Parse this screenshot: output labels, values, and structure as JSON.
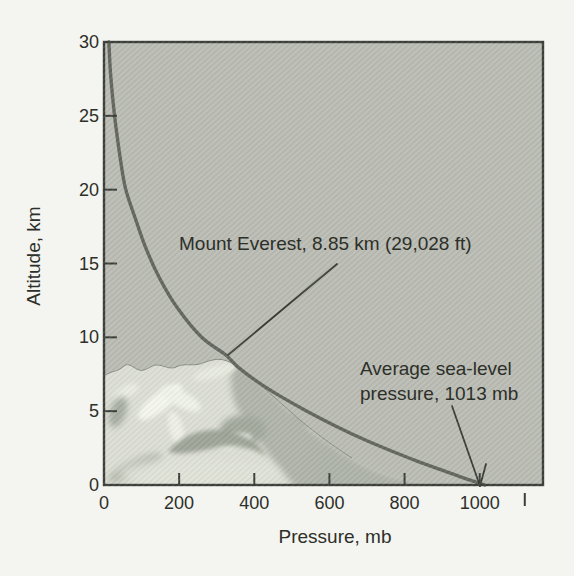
{
  "page": {
    "background_color": "#f4f4f0"
  },
  "chart_data": {
    "type": "line",
    "title": "",
    "xlabel": "Pressure, mb",
    "ylabel": "Altitude, km",
    "xlim": [
      0,
      1170
    ],
    "ylim": [
      0,
      30
    ],
    "x_ticks": [
      0,
      200,
      400,
      600,
      800,
      1000
    ],
    "y_ticks": [
      0,
      5,
      10,
      15,
      20,
      25,
      30
    ],
    "x_unlabeled_minor_tick": 1120,
    "grid": false,
    "legend": null,
    "plot_background": "#babcb4",
    "curve_color": "#63665e",
    "axis_color": "#3c3e39",
    "text_color": "#2d2f29",
    "series": [
      {
        "name": "atmospheric-pressure-vs-altitude",
        "points": [
          {
            "altitude_km": 0,
            "pressure_mb": 1013
          },
          {
            "altitude_km": 0.5,
            "pressure_mb": 955
          },
          {
            "altitude_km": 1,
            "pressure_mb": 900
          },
          {
            "altitude_km": 1.5,
            "pressure_mb": 846
          },
          {
            "altitude_km": 2,
            "pressure_mb": 795
          },
          {
            "altitude_km": 3,
            "pressure_mb": 700
          },
          {
            "altitude_km": 4,
            "pressure_mb": 616
          },
          {
            "altitude_km": 5,
            "pressure_mb": 540
          },
          {
            "altitude_km": 6,
            "pressure_mb": 470
          },
          {
            "altitude_km": 7,
            "pressure_mb": 408
          },
          {
            "altitude_km": 8,
            "pressure_mb": 356
          },
          {
            "altitude_km": 8.85,
            "pressure_mb": 322
          },
          {
            "altitude_km": 10,
            "pressure_mb": 260
          },
          {
            "altitude_km": 12,
            "pressure_mb": 195
          },
          {
            "altitude_km": 14,
            "pressure_mb": 148
          },
          {
            "altitude_km": 16,
            "pressure_mb": 112
          },
          {
            "altitude_km": 18,
            "pressure_mb": 84
          },
          {
            "altitude_km": 20,
            "pressure_mb": 58
          },
          {
            "altitude_km": 22,
            "pressure_mb": 44
          },
          {
            "altitude_km": 24,
            "pressure_mb": 33
          },
          {
            "altitude_km": 26,
            "pressure_mb": 24
          },
          {
            "altitude_km": 28,
            "pressure_mb": 17
          },
          {
            "altitude_km": 30,
            "pressure_mb": 13
          }
        ]
      }
    ],
    "annotations": [
      {
        "id": "everest",
        "text": "Mount Everest, 8.85 km (29,028 ft)",
        "target": {
          "altitude_km": 8.85,
          "pressure_mb": 322
        }
      },
      {
        "id": "sea-level",
        "text": "Average sea-level pressure, 1013 mb",
        "lines": [
          "Average sea-level",
          "pressure, 1013 mb"
        ],
        "target": {
          "altitude_km": 0,
          "pressure_mb": 1013
        }
      }
    ],
    "illustration": "shaded mountain terrain in lower-left of plot"
  }
}
